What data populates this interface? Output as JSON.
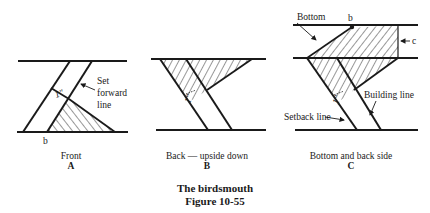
{
  "figure": {
    "title": "The birdsmouth",
    "number": "Figure 10-55"
  },
  "panels": [
    {
      "id": "A",
      "caption": "Front",
      "letter": "A",
      "labels": {
        "set_forward_1": "Set",
        "set_forward_2": "forward",
        "set_forward_3": "line",
        "b": "b",
        "dimension": "1\""
      }
    },
    {
      "id": "B",
      "caption": "Back — upside down",
      "letter": "B",
      "labels": {
        "dimension": "1\""
      }
    },
    {
      "id": "C",
      "caption": "Bottom and back side",
      "letter": "C",
      "labels": {
        "bottom": "Bottom",
        "b": "b",
        "c": "c",
        "building_line": "Building line",
        "setback_line": "Setback line",
        "dimension": "1\""
      }
    }
  ],
  "colors": {
    "ink": "#1a1a1a",
    "background": "#ffffff"
  }
}
